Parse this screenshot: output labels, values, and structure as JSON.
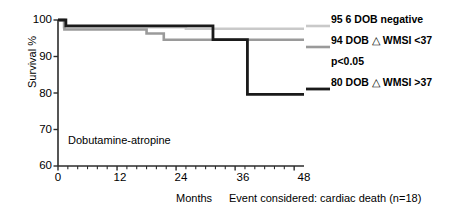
{
  "chart_data": {
    "type": "line",
    "title": "",
    "xlabel": "Months",
    "ylabel": "Survival %",
    "xlim": [
      0,
      50
    ],
    "ylim": [
      60,
      100
    ],
    "xticks": [
      0,
      12,
      24,
      36,
      48
    ],
    "xticklabels": [
      "0",
      "12",
      "24",
      "36",
      "48"
    ],
    "yticks": [
      60,
      70,
      80,
      90,
      100
    ],
    "yticklabels": [
      "60",
      "70",
      "80",
      "90",
      "100"
    ],
    "grid": false,
    "legend_position": "right",
    "minor_xticks": true,
    "annotations": [
      {
        "name": "group-annotation",
        "text": "Dobutamine-atropine"
      },
      {
        "name": "event-note",
        "text": "Event considered: cardiac death (n=18)"
      },
      {
        "name": "significance",
        "text": "p<0.05"
      }
    ],
    "series": [
      {
        "name": "95 6 DOB negative",
        "label": "95 6 DOB negative",
        "color": "#c9c9c9",
        "linewidth": 2.6,
        "step": "post",
        "x": [
          0,
          1.2,
          1.2,
          26.0,
          26.0,
          50.0
        ],
        "y": [
          100,
          100,
          98.0,
          98.0,
          97.6,
          97.6
        ]
      },
      {
        "name": "94 DOB delta WMSI <37",
        "label": "94 DOB △ WMSI <37",
        "color": "#9a9a9a",
        "linewidth": 2.6,
        "step": "post",
        "x": [
          0,
          1.3,
          1.3,
          18.0,
          18.0,
          21.5,
          21.5,
          50.0
        ],
        "y": [
          100,
          100,
          97.4,
          97.4,
          96.3,
          96.3,
          94.6,
          94.6
        ]
      },
      {
        "name": "80 DOB delta WMSI >37",
        "label": "80 DOB △ WMSI >37",
        "color": "#1a1a1a",
        "linewidth": 2.8,
        "step": "post",
        "x": [
          0,
          1.6,
          1.6,
          31.5,
          31.5,
          38.5,
          38.5,
          50.0
        ],
        "y": [
          100,
          100,
          98.4,
          98.4,
          94.6,
          94.6,
          79.6,
          79.6
        ]
      }
    ]
  },
  "legend": {
    "rows": [
      {
        "name": "legend-dob-negative",
        "text": "95 6 DOB negative"
      },
      {
        "name": "legend-wmsi-low",
        "pre": "94 DOB ",
        "symbol": "△",
        "post": " WMSI <37"
      },
      {
        "name": "legend-pvalue",
        "text": "p<0.05"
      },
      {
        "name": "legend-wmsi-high",
        "pre": "80 DOB ",
        "symbol": "△",
        "post": " WMSI >37"
      }
    ]
  },
  "axes": {
    "ylabel": "Survival %",
    "xlabel": "Months",
    "ytick_labels": [
      "100",
      "90",
      "80",
      "70",
      "60"
    ],
    "xtick_labels": [
      "0",
      "12",
      "24",
      "36",
      "48"
    ]
  },
  "notes": {
    "plot_annotation": "Dobutamine-atropine",
    "event_caption": "Event considered: cardiac death (n=18)"
  }
}
